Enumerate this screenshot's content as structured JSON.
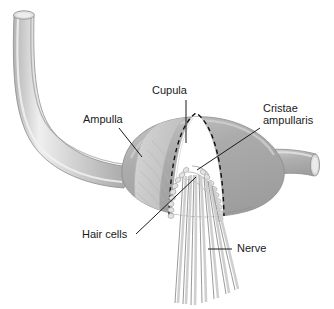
{
  "figure": {
    "background_color": "#ffffff",
    "width": 334,
    "height": 309
  },
  "labels": [
    {
      "id": "cupula",
      "text": "Cupula",
      "x": 152,
      "y": 94
    },
    {
      "id": "ampulla",
      "text": "Ampulla",
      "x": 83,
      "y": 123
    },
    {
      "id": "cristae_line1",
      "text": "Cristae",
      "x": 263,
      "y": 112
    },
    {
      "id": "cristae_line2",
      "text": "ampullaris",
      "x": 263,
      "y": 124
    },
    {
      "id": "hair_cells",
      "text": "Hair cells",
      "x": 82,
      "y": 238
    },
    {
      "id": "nerve",
      "text": "Nerve",
      "x": 237,
      "y": 252
    }
  ],
  "colors": {
    "background": "#ffffff",
    "text": "#1a1a1a",
    "leader_line": "#1a1a1a",
    "canal_tube": "#c6c6c6",
    "canal_tube_highlight": "#e8e8e8",
    "canal_tube_shadow": "#a9a9a9",
    "tube_opening": "#dcdcdc",
    "ampulla_body": "#a9a9a9",
    "ampulla_highlight": "#c3c3c3",
    "cupula_fill": "#c9c9c9",
    "cutaway_white": "#ffffff",
    "hair_cell": "#e3e3e3",
    "hair_cell_outline": "#8f8f8f",
    "nerve_fiber": "#9a9a9a",
    "outline": "#8d8d8d",
    "dashed_outline": "#111111"
  },
  "structures": [
    {
      "id": "semicircular-canal",
      "name": "semicircular canal tube",
      "description": "long hooked tube entering from upper left with open elliptical end"
    },
    {
      "id": "ampulla-bulb",
      "name": "ampulla",
      "description": "large lens-shaped swelling in the center right"
    },
    {
      "id": "cupula-wedge",
      "name": "cupula",
      "description": "light gelatinous wedge inside the ampulla"
    },
    {
      "id": "crista-ampullaris",
      "name": "cristae ampullaris",
      "description": "ridge bearing the sensory hair cells"
    },
    {
      "id": "hair-cell-rows",
      "name": "hair cells",
      "description": "two curved beaded rows of sensory cells"
    },
    {
      "id": "nerve-bundle",
      "name": "vestibular nerve",
      "description": "bundle of seven fibers descending from the crista"
    },
    {
      "id": "exit-tube",
      "name": "canal continuation",
      "description": "short tube exiting to the right with open end"
    }
  ]
}
